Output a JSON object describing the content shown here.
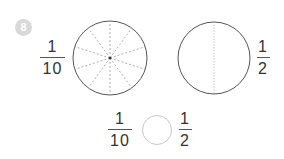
{
  "problem": {
    "number": "8",
    "badge_color": "#d9d9d9"
  },
  "figures": {
    "left_circle": {
      "parts": 10,
      "divider_style": "dashed"
    },
    "right_circle": {
      "parts": 2,
      "divider_style": "dotted"
    }
  },
  "fractions": {
    "left": {
      "numerator": "1",
      "denominator": "10"
    },
    "right": {
      "numerator": "1",
      "denominator": "2"
    },
    "compare_left": {
      "numerator": "1",
      "denominator": "10"
    },
    "compare_right": {
      "numerator": "1",
      "denominator": "2"
    }
  },
  "comparison_blank": ""
}
